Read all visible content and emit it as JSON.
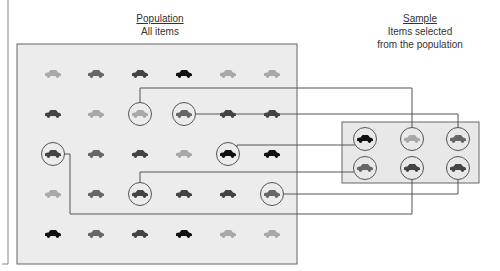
{
  "population": {
    "title": "Population",
    "subtitle": "All items",
    "box": {
      "x": 17,
      "y": 44,
      "w": 280,
      "h": 220,
      "fill": "#ececec",
      "stroke": "#666666"
    },
    "cols": [
      53,
      96,
      140,
      184,
      228,
      272
    ],
    "rows": [
      74,
      114,
      154,
      194,
      234
    ],
    "colors": {
      "black": "#111111",
      "dark": "#444444",
      "mid": "#666666",
      "light": "#a8a8a8"
    },
    "grid": [
      [
        "light",
        "mid",
        "dark",
        "black",
        "light",
        "light"
      ],
      [
        "dark",
        "light",
        "light",
        "mid",
        "dark",
        "dark"
      ],
      [
        "dark",
        "mid",
        "dark",
        "light",
        "black",
        "black"
      ],
      [
        "light",
        "mid",
        "dark",
        "dark",
        "dark",
        "mid"
      ],
      [
        "black",
        "mid",
        "dark",
        "black",
        "light",
        "light"
      ]
    ],
    "selected": [
      [
        1,
        2
      ],
      [
        1,
        3
      ],
      [
        2,
        0
      ],
      [
        2,
        4
      ],
      [
        3,
        2
      ],
      [
        3,
        5
      ]
    ]
  },
  "sample": {
    "title": "Sample",
    "subtitle_line1": "Items selected",
    "subtitle_line2": "from the population",
    "box": {
      "x": 342,
      "y": 122,
      "w": 137,
      "h": 61,
      "fill": "#e8e8e8",
      "stroke": "#666666"
    },
    "cols": [
      365,
      412,
      458
    ],
    "rows": [
      139,
      168
    ],
    "grid": [
      [
        "black",
        "light",
        "mid"
      ],
      [
        "mid",
        "dark",
        "dark"
      ]
    ]
  },
  "connections": [
    {
      "from": [
        1,
        2
      ],
      "to": [
        0,
        1
      ]
    },
    {
      "from": [
        1,
        3
      ],
      "to": [
        0,
        2
      ]
    },
    {
      "from": [
        2,
        4
      ],
      "to": [
        0,
        0
      ]
    },
    {
      "from": [
        3,
        2
      ],
      "to": [
        1,
        0
      ]
    },
    {
      "from": [
        3,
        5
      ],
      "to": [
        1,
        2
      ]
    },
    {
      "from": [
        2,
        0
      ],
      "to": [
        1,
        1
      ]
    }
  ]
}
